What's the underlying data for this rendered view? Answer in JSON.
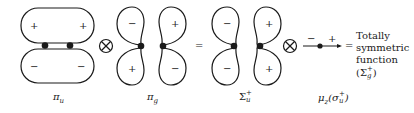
{
  "diagram": {
    "terms": [
      {
        "id": "pi_u",
        "label": "π",
        "label_sub": "u",
        "lobe_signs": {
          "top_left": "+",
          "top_right": "+",
          "bottom_left": "−",
          "bottom_right": "−"
        }
      },
      {
        "id": "pi_g",
        "label": "π",
        "label_sub": "g",
        "lobe_signs": {
          "top_left": "−",
          "top_right": "+",
          "bottom_left": "+",
          "bottom_right": "−"
        }
      },
      {
        "id": "sigma_u_plus",
        "label": "Σ",
        "label_sup": "+",
        "label_sub": "u",
        "lobe_signs": {
          "top_left": "−",
          "top_right": "+",
          "bottom_left": "−",
          "bottom_right": "+"
        }
      },
      {
        "id": "mu_z",
        "label": "μ",
        "label_sub": "z",
        "label_paren": "(σ",
        "label_paren_sup": "+",
        "label_paren_sub": "u",
        "label_paren_close": ")",
        "signs": {
          "left": "−",
          "right": "+"
        }
      }
    ],
    "operators": {
      "tensor1": "⊗",
      "equals1": "=",
      "tensor2": "⊗",
      "equals2": "="
    },
    "result": {
      "line1": "Totally",
      "line2": "symmetric",
      "line3": "function",
      "sym_open": "(Σ",
      "sym_sup": "+",
      "sym_sub": "g",
      "sym_close": ")"
    }
  }
}
